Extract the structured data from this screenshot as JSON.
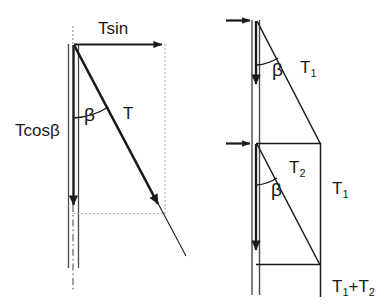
{
  "figure": {
    "stroke_color": "#1a1a1a",
    "guide_color": "#b0b0b0",
    "background": "#ffffff"
  },
  "left_diagram": {
    "name": "single-tension-decomposition",
    "labels": {
      "horizontal_component": "Tsin",
      "vertical_component": "Tcosβ",
      "angle": "β",
      "resultant": "T"
    }
  },
  "right_diagram": {
    "name": "two-tension-stacked-decomposition",
    "labels": {
      "angle_upper": "β",
      "angle_lower": "β",
      "tension_upper": "T",
      "tension_upper_sub": "1",
      "tension_lower": "T",
      "tension_lower_sub": "2",
      "reaction_middle": "T",
      "reaction_middle_sub": "1",
      "reaction_bottom_a": "T",
      "reaction_bottom_a_sub": "1",
      "reaction_bottom_plus": "+T",
      "reaction_bottom_b_sub": "2"
    }
  }
}
